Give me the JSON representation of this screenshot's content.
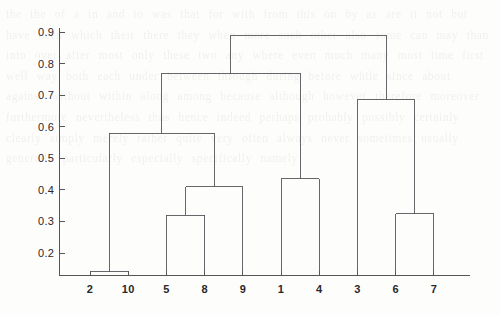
{
  "figure": {
    "background_color": "#fdfdfc",
    "line_color": "#56555a",
    "axis_color": "#56555a",
    "text_color": "#29282b"
  },
  "background_text": "the the of a in and to was that for with from this on by as are it not but have been which their there they when more such other also some can may than into over after most only these two any where even much many most time first well way both each under between through during before while since about against without within along among because although however therefore moreover furthermore nevertheless thus hence indeed perhaps probably possibly certainly clearly simply merely rather quite very often always never sometimes usually generally particularly especially specifically namely",
  "chart_data": {
    "type": "dendrogram",
    "title": "",
    "xlabel": "",
    "ylabel": "",
    "ylim": [
      0.12,
      0.93
    ],
    "yticks": [
      0.2,
      0.3,
      0.4,
      0.5,
      0.6,
      0.7,
      0.8,
      0.9
    ],
    "ytick_labels": [
      "0.2",
      "0.3",
      "0.4",
      "0.5",
      "0.6",
      "0.7",
      "0.8",
      "0.9"
    ],
    "grid": false,
    "legend": false,
    "leaf_order": [
      "2",
      "10",
      "5",
      "8",
      "9",
      "1",
      "4",
      "3",
      "6",
      "7"
    ],
    "leaf_positions": [
      1,
      2,
      3,
      4,
      5,
      6,
      7,
      8,
      9,
      10
    ],
    "n_leaves": 10,
    "merges": [
      {
        "id": "m1",
        "label": "2 + 10",
        "left": "2",
        "right": "10",
        "height": 0.14
      },
      {
        "id": "m2",
        "label": "5 + 8",
        "left": "5",
        "right": "8",
        "height": 0.32
      },
      {
        "id": "m3",
        "label": "(5,8) + 9",
        "left": "m2",
        "right": "9",
        "height": 0.41
      },
      {
        "id": "m4",
        "label": "1 + 4",
        "left": "1",
        "right": "4",
        "height": 0.435
      },
      {
        "id": "m5",
        "label": "6 + 7",
        "left": "6",
        "right": "7",
        "height": 0.325
      },
      {
        "id": "m6",
        "label": "(2,10) + (5,8,9)",
        "left": "m1",
        "right": "m3",
        "height": 0.58
      },
      {
        "id": "m7",
        "label": "3 + (6,7)",
        "left": "3",
        "right": "m5",
        "height": 0.685
      },
      {
        "id": "m8",
        "label": "(2,10,5,8,9) + (1,4)",
        "left": "m6",
        "right": "m4",
        "height": 0.77
      },
      {
        "id": "m9",
        "label": "root",
        "left": "m8",
        "right": "m7",
        "height": 0.89
      }
    ]
  },
  "axes": {
    "y_axis_name": "height",
    "x_axis_name": "object",
    "tick_count_y": 8,
    "tick_count_x": 10
  }
}
